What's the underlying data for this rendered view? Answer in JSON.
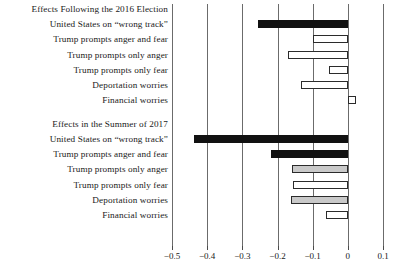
{
  "chart_data": {
    "type": "bar",
    "orientation": "horizontal",
    "title": "",
    "xlabel": "",
    "ylabel": "",
    "xlim": [
      -0.5,
      0.1
    ],
    "xticks": [
      -0.5,
      -0.4,
      -0.3,
      -0.2,
      -0.1,
      0,
      0.1
    ],
    "xticklabels": [
      "−0.5",
      "−0.4",
      "−0.3",
      "−0.2",
      "−0.1",
      "0",
      "0.1"
    ],
    "grid": true,
    "grid_axis": "x",
    "legend": "none",
    "groups": [
      {
        "heading": "Effects Following the 2016 Election",
        "categories": [
          "United States on “wrong track”",
          "Trump prompts anger and fear",
          "Trump prompts only anger",
          "Trump prompts only fear",
          "Deportation worries",
          "Financial worries"
        ],
        "values": [
          -0.255,
          -0.1,
          -0.17,
          -0.054,
          -0.132,
          0.024
        ],
        "styles": [
          "solid",
          "open",
          "open",
          "open",
          "open",
          "open"
        ]
      },
      {
        "heading": "Effects in the Summer of 2017",
        "categories": [
          "United States on “wrong track”",
          "Trump prompts anger and fear",
          "Trump prompts only anger",
          "Trump prompts only fear",
          "Deportation worries",
          "Financial worries"
        ],
        "values": [
          -0.438,
          -0.218,
          -0.16,
          -0.157,
          -0.163,
          -0.062
        ],
        "styles": [
          "solid",
          "solid",
          "gray",
          "open",
          "gray",
          "open"
        ]
      }
    ]
  }
}
